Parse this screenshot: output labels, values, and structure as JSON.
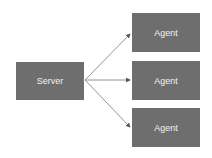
{
  "colors": {
    "node_fill": "#6e6e6e",
    "node_text": "#f2f2f2",
    "edge": "#777777",
    "background": "#ffffff"
  },
  "nodes": {
    "server": {
      "label": "Server"
    },
    "agents": [
      {
        "label": "Agent"
      },
      {
        "label": "Agent"
      },
      {
        "label": "Agent"
      }
    ]
  },
  "edges": [
    {
      "from": "Server",
      "to": "Agent 1"
    },
    {
      "from": "Server",
      "to": "Agent 2"
    },
    {
      "from": "Server",
      "to": "Agent 3"
    }
  ]
}
